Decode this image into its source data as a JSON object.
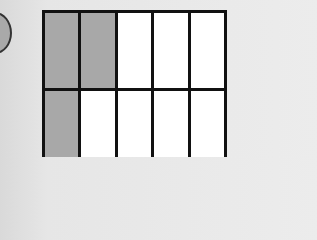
{
  "diagram": {
    "type": "fraction-grid",
    "rows": 2,
    "columns": 5,
    "colors": {
      "shaded": "#a8a8a8",
      "unshaded": "#ffffff",
      "border": "#111111",
      "circle": "#a9a9a9"
    },
    "cells": [
      [
        true,
        true,
        false,
        false,
        false
      ],
      [
        true,
        false,
        false,
        false,
        false
      ]
    ],
    "shaded_count": 3,
    "total_cells_visible": 10
  }
}
